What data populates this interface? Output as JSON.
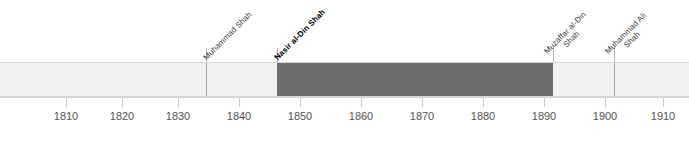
{
  "chart_data": {
    "type": "bar",
    "title": "",
    "subtitle": "",
    "xlabel": "",
    "ylabel": "",
    "orientation": "horizontal-timeline",
    "grid": false,
    "legend": "none",
    "xlim": [
      1803,
      1915
    ],
    "x_ticks": [
      1810,
      1820,
      1830,
      1840,
      1850,
      1860,
      1870,
      1880,
      1890,
      1900,
      1910
    ],
    "x_tick_labels": [
      "1810",
      "1820",
      "1830",
      "1840",
      "1850",
      "1860",
      "1870",
      "1880",
      "1890",
      "1900",
      "1910"
    ],
    "categories": [
      "Fath-Ali Shah",
      "Muhammad Shah",
      "Nasir al-Din Shah",
      "Muzaffar al-Din Shah",
      "Muhammad Ali Shah"
    ],
    "segments": [
      {
        "label": "",
        "start": 1803,
        "end": 1834,
        "color": "#f2f2f2",
        "highlight": false,
        "label_shown": false
      },
      {
        "label": "Muhammad Shah",
        "start": 1834,
        "end": 1848,
        "color": "#f2f2f2",
        "highlight": false,
        "label_shown": true
      },
      {
        "label": "Nasir al-Din Shah",
        "start": 1848,
        "end": 1896,
        "color": "#6e6e6e",
        "highlight": true,
        "label_shown": true
      },
      {
        "label": "Muzaffar al-Din Shah",
        "start": 1896,
        "end": 1907,
        "color": "#f2f2f2",
        "highlight": false,
        "label_shown": true
      },
      {
        "label": "Muhammad Ali Shah",
        "start": 1907,
        "end": 1915,
        "color": "#f2f2f2",
        "highlight": false,
        "label_shown": true
      }
    ],
    "values": [
      31,
      14,
      48,
      11,
      8
    ],
    "colors": {
      "highlight": "#6e6e6e",
      "default": "#f2f2f2",
      "border": "#d8d8d8",
      "tick": "#c8c8c8",
      "text": "#555555"
    }
  },
  "axis": {
    "ticks": [
      {
        "label": "1810",
        "x": 66
      },
      {
        "label": "1820",
        "x": 122
      },
      {
        "label": "1830",
        "x": 178
      },
      {
        "label": "1840",
        "x": 239
      },
      {
        "label": "1850",
        "x": 300
      },
      {
        "label": "1860",
        "x": 361
      },
      {
        "label": "1870",
        "x": 422
      },
      {
        "label": "1880",
        "x": 483
      },
      {
        "label": "1890",
        "x": 544
      },
      {
        "label": "1900",
        "x": 605
      },
      {
        "label": "1910",
        "x": 663
      }
    ]
  },
  "reigns": {
    "muhammad_shah": {
      "name": "Muhammad Shah",
      "line1": "Muhammad Shah",
      "line2": ""
    },
    "nasir_al_din_shah": {
      "name": "Nasir al-Din Shah",
      "line1": "Nasir al-Din Shah",
      "line2": ""
    },
    "muzaffar_al_din_shah": {
      "name": "Muzaffar al-Din Shah",
      "line1": "Muzaffar al-Din",
      "line2": "Shah"
    },
    "muhammad_ali_shah": {
      "name": "Muhammad Ali Shah",
      "line1": "Muhammad Ali",
      "line2": "Shah"
    }
  }
}
